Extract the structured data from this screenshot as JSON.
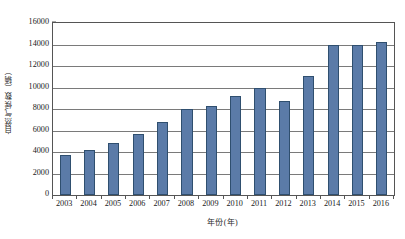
{
  "chart_data": {
    "type": "bar",
    "title": "",
    "xlabel": "年份(年)",
    "ylabel": "自然气候数（辆）",
    "categories": [
      "2003",
      "2004",
      "2005",
      "2006",
      "2007",
      "2008",
      "2009",
      "2010",
      "2011",
      "2012",
      "2013",
      "2014",
      "2015",
      "2016"
    ],
    "values": [
      3700,
      4200,
      4800,
      5700,
      6800,
      8000,
      8300,
      9200,
      10000,
      8700,
      11100,
      14000,
      14000,
      14200
    ],
    "series": [
      {
        "name": "自然气候数（辆）",
        "values": [
          3700,
          4200,
          4800,
          5700,
          6800,
          8000,
          8300,
          9200,
          10000,
          8700,
          11100,
          14000,
          14000,
          14200
        ]
      }
    ],
    "ylim": [
      0,
      16000
    ],
    "yticks": [
      0,
      2000,
      4000,
      6000,
      8000,
      10000,
      12000,
      14000,
      16000
    ],
    "ytick_labels": [
      "0",
      "2000",
      "4000",
      "6000",
      "8000",
      "10000",
      "12000",
      "14000",
      "16000"
    ],
    "grid": true,
    "grid_axis": "y",
    "legend": false,
    "bar_color": "#5b7ba8",
    "bar_edge_color": "#2f4f6f",
    "axis_color": "#555555",
    "gridline_color": "#7a7a7a"
  }
}
